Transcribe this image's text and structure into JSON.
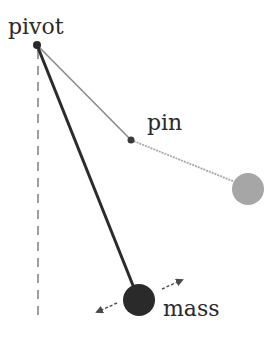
{
  "diagram": {
    "type": "double pendulum / pinned pendulum schematic",
    "labels": {
      "pivot": "pivot",
      "pin": "pin",
      "mass": "mass"
    },
    "points": {
      "pivot": {
        "x": 37,
        "y": 45
      },
      "pin": {
        "x": 131,
        "y": 140
      },
      "mass": {
        "x": 139,
        "y": 300,
        "r": 16
      },
      "swung_mass": {
        "x": 248,
        "y": 189,
        "r": 16
      }
    },
    "vertical_reference": {
      "x": 38,
      "y1": 50,
      "y2": 322
    },
    "motion_arrows": [
      {
        "from": {
          "x": 117,
          "y": 303
        },
        "to": {
          "x": 95,
          "y": 313
        }
      },
      {
        "from": {
          "x": 162,
          "y": 289
        },
        "to": {
          "x": 184,
          "y": 279
        }
      }
    ],
    "colors": {
      "rod": "#2b2b2b",
      "mass": "#2a2a2a",
      "pin_rod": "#8a8a8a",
      "swung_rod": "#a8a8a8",
      "swung_mass": "#a6a6a6",
      "dashed": "#6a6a6a",
      "text": "#2a2a2a"
    }
  }
}
